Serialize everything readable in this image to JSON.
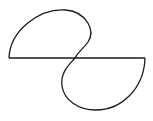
{
  "diagram": {
    "stroke_color": "#1a1a1a",
    "background": "#ffffff",
    "elements": [
      {
        "type": "line",
        "name": "horizontal-axis",
        "from": [
          9,
          58
        ],
        "to": [
          145,
          58
        ]
      },
      {
        "type": "curve",
        "name": "upper-lobe",
        "from": [
          9,
          58
        ],
        "through": [
          [
            30,
            15
          ],
          [
            80,
            10
          ],
          [
            88,
            38
          ]
        ],
        "to": [
          75,
          58
        ]
      },
      {
        "type": "curve",
        "name": "lower-lobe",
        "from": [
          75,
          58
        ],
        "through": [
          [
            58,
            80
          ],
          [
            70,
            112
          ],
          [
            125,
            108
          ]
        ],
        "to": [
          145,
          58
        ]
      }
    ]
  }
}
